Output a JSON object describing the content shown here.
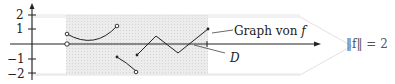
{
  "diagram": {
    "y_ticks": [
      {
        "label": "2",
        "value": 2
      },
      {
        "label": "1",
        "value": 1
      },
      {
        "label": "−1",
        "value": -1
      },
      {
        "label": "−2",
        "value": -2
      }
    ],
    "graph_label_prefix": "Graph von ",
    "graph_label_var": "f",
    "domain_label": "D",
    "norm_label": "‖f‖ = 2",
    "colors": {
      "shade": "#e6e6e6",
      "curve": "#222222",
      "arrow_shape": "#e0e0e0"
    }
  }
}
